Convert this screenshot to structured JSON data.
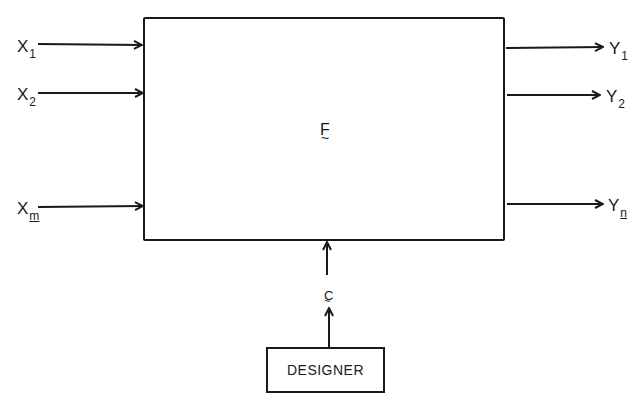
{
  "diagram": {
    "system_block": {
      "label": "F",
      "label_mark": "~"
    },
    "inputs": [
      {
        "base": "X",
        "sub": "1",
        "sub_underlined": false
      },
      {
        "base": "X",
        "sub": "2",
        "sub_underlined": false
      },
      {
        "base": "X",
        "sub": "m",
        "sub_underlined": true
      }
    ],
    "outputs": [
      {
        "base": "Y",
        "sub": "1",
        "sub_underlined": false
      },
      {
        "base": "Y",
        "sub": "2",
        "sub_underlined": false
      },
      {
        "base": "Y",
        "sub": "n",
        "sub_underlined": true
      }
    ],
    "control": {
      "label": "C",
      "label_mark": "~"
    },
    "designer": {
      "label": "DESIGNER"
    },
    "colors": {
      "ink": "#1a1a1a",
      "background": "#ffffff"
    }
  }
}
